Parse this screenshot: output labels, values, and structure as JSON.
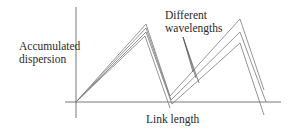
{
  "labels": {
    "y_axis_line1": "Accumulated",
    "y_axis_line2": "dispersion",
    "x_axis": "Link length",
    "annotation_line1": "Different",
    "annotation_line2": "wavelengths"
  },
  "colors": {
    "axis": "#555555",
    "curve": "#7a7a7a",
    "text": "#2a2a2a"
  },
  "diagram": {
    "origin": [
      76,
      102
    ],
    "x_axis": {
      "from": [
        65,
        102
      ],
      "to": [
        281,
        102
      ]
    },
    "y_axis": {
      "from": [
        76,
        118
      ],
      "to": [
        76,
        7
      ]
    },
    "wavelength_traces": [
      {
        "name": "wavelength-1",
        "points": [
          [
            76,
            102
          ],
          [
            146,
            24
          ],
          [
            170,
            96
          ],
          [
            240,
            19
          ],
          [
            264,
            90
          ]
        ]
      },
      {
        "name": "wavelength-2",
        "points": [
          [
            76,
            102
          ],
          [
            146,
            28
          ],
          [
            171,
            100
          ],
          [
            240,
            32
          ],
          [
            266,
            102
          ]
        ]
      },
      {
        "name": "wavelength-3",
        "points": [
          [
            76,
            102
          ],
          [
            146,
            32
          ],
          [
            172,
            104
          ],
          [
            240,
            43
          ],
          [
            264,
            115
          ]
        ]
      },
      {
        "name": "wavelength-4",
        "points": [
          [
            76,
            102
          ],
          [
            145,
            36
          ],
          [
            170,
            108
          ]
        ]
      }
    ],
    "pointer_lines": [
      {
        "from": [
          183,
          37
        ],
        "to": [
          193,
          72
        ]
      },
      {
        "from": [
          183,
          37
        ],
        "to": [
          196,
          78
        ]
      },
      {
        "from": [
          183,
          37
        ],
        "to": [
          199,
          83
        ]
      }
    ]
  }
}
